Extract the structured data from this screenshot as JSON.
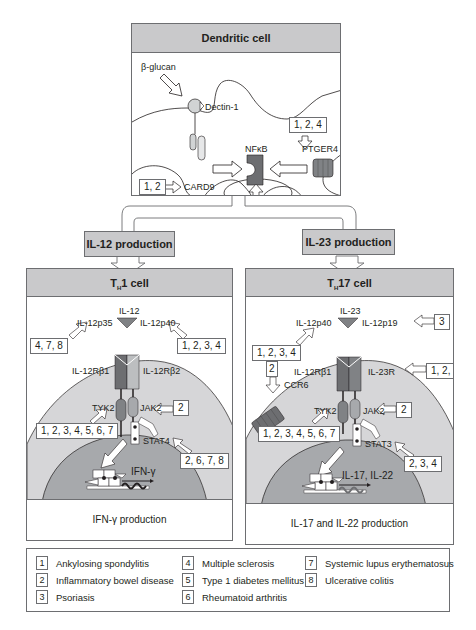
{
  "dendritic": {
    "title": "Dendritic cell",
    "beta_glucan": "β-glucan",
    "dectin": "Dectin-1",
    "card9": "CARD9",
    "nfkb": "NFκB",
    "ptger4": "PTGER4",
    "tag_card9": "1, 2",
    "tag_ptger4": "1, 2, 4",
    "tag_nfkb": "4, 7, 8"
  },
  "production": {
    "il12": "IL-12 production",
    "il23": "IL-23 production"
  },
  "th1": {
    "title_pre": "T",
    "title_sub": "H",
    "title_post": "1 cell",
    "cytokine": "IL-12",
    "p35": "IL-12p35",
    "p40": "IL-12p40",
    "tag_p35": "4, 7, 8",
    "tag_p40": "1, 2, 3, 4",
    "rb1": "IL-12Rβ1",
    "rb2": "IL-12Rβ2",
    "tyk2": "TYK2",
    "jak2": "JAK2",
    "tag_jak2": "2",
    "tag_tyk2": "1, 2, 3, 4, 5, 6, 7",
    "stat": "STAT4",
    "tag_stat": "2, 6, 7, 8",
    "gene": "IFN-γ",
    "footer": "IFN-γ production"
  },
  "th17": {
    "title_pre": "T",
    "title_sub": "H",
    "title_post": "17 cell",
    "cytokine": "IL-23",
    "p40": "IL-12p40",
    "p19": "IL-12p19",
    "tag_p40": "1, 2, 3, 4",
    "tag_p19": "3",
    "rb1": "IL-12Rβ1",
    "r23": "IL-23R",
    "tag_r23": "1, 2, 3",
    "ccr6": "CCR6",
    "tag_ccr6": "2",
    "tyk2": "TYK2",
    "jak2": "JAK2",
    "tag_jak2": "2",
    "tag_tyk2": "1, 2, 3, 4, 5, 6, 7",
    "stat": "STAT3",
    "tag_stat": "2, 3, 4",
    "gene": "IL-17, IL-22",
    "footer": "IL-17 and IL-22 production"
  },
  "legend": [
    {
      "num": "1",
      "label": "Ankylosing spondylitis"
    },
    {
      "num": "2",
      "label": "Inflammatory bowel disease"
    },
    {
      "num": "3",
      "label": "Psoriasis"
    },
    {
      "num": "4",
      "label": "Multiple sclerosis"
    },
    {
      "num": "5",
      "label": "Type 1 diabetes mellitus"
    },
    {
      "num": "6",
      "label": "Rheumatoid arthritis"
    },
    {
      "num": "7",
      "label": "Systemic lupus erythematosus"
    },
    {
      "num": "8",
      "label": "Ulcerative colitis"
    }
  ],
  "colors": {
    "header_gray": "#c9c9cb",
    "cell_gray": "#d6d6d8",
    "nucleus_gray": "#a7a9ac",
    "receptor_dark": "#6d6e71",
    "receptor_light": "#bcbec0",
    "border": "#6d6e71"
  }
}
